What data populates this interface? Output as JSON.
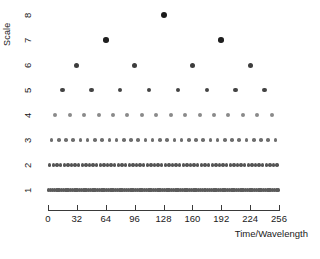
{
  "chart_data": {
    "type": "scatter",
    "title": "",
    "xlabel": "Time/Wavelength",
    "ylabel": "Scale",
    "xlim": [
      0,
      256
    ],
    "ylim": [
      0.5,
      8.5
    ],
    "grid": false,
    "legend": null,
    "xticks": [
      0,
      32,
      64,
      96,
      128,
      160,
      192,
      224,
      256
    ],
    "xticklabels": [
      "0",
      "32",
      "64",
      "96",
      "128",
      "160",
      "192",
      "224",
      "256"
    ],
    "yticks": [
      1,
      2,
      3,
      4,
      5,
      6,
      7,
      8
    ],
    "yticklabels": [
      "1",
      "2",
      "3",
      "4",
      "5",
      "6",
      "7",
      "8"
    ],
    "point_color": "#2b2b2b",
    "axis_color": "#3a3a3a",
    "series": [
      {
        "name": "scale-8",
        "scale": 8,
        "n_points": 1,
        "marker_size": 3.0,
        "marker_color": "#1a1a1a",
        "x": [
          128
        ]
      },
      {
        "name": "scale-7",
        "scale": 7,
        "n_points": 2,
        "marker_size": 2.8,
        "marker_color": "#1f1f1f",
        "x": [
          64,
          192
        ]
      },
      {
        "name": "scale-6",
        "scale": 6,
        "n_points": 4,
        "marker_size": 2.5,
        "marker_color": "#3d3d3d",
        "x": [
          32,
          96,
          160,
          224
        ]
      },
      {
        "name": "scale-5",
        "scale": 5,
        "n_points": 8,
        "marker_size": 2.3,
        "marker_color": "#444444",
        "x": [
          16,
          48,
          80,
          112,
          144,
          176,
          208,
          240
        ]
      },
      {
        "name": "scale-4",
        "scale": 4,
        "n_points": 16,
        "marker_size": 2.0,
        "marker_color": "#8a8a8a",
        "x": [
          8,
          24,
          40,
          56,
          72,
          88,
          104,
          120,
          136,
          152,
          168,
          184,
          200,
          216,
          232,
          248
        ]
      },
      {
        "name": "scale-3",
        "scale": 3,
        "n_points": 32,
        "marker_size": 1.8,
        "marker_color": "#6e6e6e",
        "x": [
          4,
          12,
          20,
          28,
          36,
          44,
          52,
          60,
          68,
          76,
          84,
          92,
          100,
          108,
          116,
          124,
          132,
          140,
          148,
          156,
          164,
          172,
          180,
          188,
          196,
          204,
          212,
          220,
          228,
          236,
          244,
          252
        ]
      },
      {
        "name": "scale-2",
        "scale": 2,
        "n_points": 64,
        "marker_size": 1.7,
        "marker_color": "#555555",
        "x": [
          2,
          6,
          10,
          14,
          18,
          22,
          26,
          30,
          34,
          38,
          42,
          46,
          50,
          54,
          58,
          62,
          66,
          70,
          74,
          78,
          82,
          86,
          90,
          94,
          98,
          102,
          106,
          110,
          114,
          118,
          122,
          126,
          130,
          134,
          138,
          142,
          146,
          150,
          154,
          158,
          162,
          166,
          170,
          174,
          178,
          182,
          186,
          190,
          194,
          198,
          202,
          206,
          210,
          214,
          218,
          222,
          226,
          230,
          234,
          238,
          242,
          246,
          250,
          254
        ]
      },
      {
        "name": "scale-1",
        "scale": 1,
        "n_points": 128,
        "marker_size": 1.6,
        "marker_color": "#5a5a5a",
        "x": [
          1,
          3,
          5,
          7,
          9,
          11,
          13,
          15,
          17,
          19,
          21,
          23,
          25,
          27,
          29,
          31,
          33,
          35,
          37,
          39,
          41,
          43,
          45,
          47,
          49,
          51,
          53,
          55,
          57,
          59,
          61,
          63,
          65,
          67,
          69,
          71,
          73,
          75,
          77,
          79,
          81,
          83,
          85,
          87,
          89,
          91,
          93,
          95,
          97,
          99,
          101,
          103,
          105,
          107,
          109,
          111,
          113,
          115,
          117,
          119,
          121,
          123,
          125,
          127,
          129,
          131,
          133,
          135,
          137,
          139,
          141,
          143,
          145,
          147,
          149,
          151,
          153,
          155,
          157,
          159,
          161,
          163,
          165,
          167,
          169,
          171,
          173,
          175,
          177,
          179,
          181,
          183,
          185,
          187,
          189,
          191,
          193,
          195,
          197,
          199,
          201,
          203,
          205,
          207,
          209,
          211,
          213,
          215,
          217,
          219,
          221,
          223,
          225,
          227,
          229,
          231,
          233,
          235,
          237,
          239,
          241,
          243,
          245,
          247,
          249,
          251,
          253,
          255
        ]
      }
    ]
  }
}
